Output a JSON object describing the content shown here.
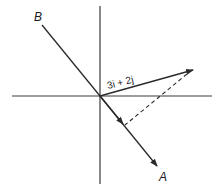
{
  "diagram": {
    "type": "vector-projection",
    "colors": {
      "line": "#2a2a2a",
      "background": "#ffffff"
    },
    "labels": {
      "point_b": "B",
      "point_a": "A",
      "vector": "3i + 2j"
    },
    "elements": [
      {
        "name": "x-axis",
        "kind": "axis"
      },
      {
        "name": "y-axis",
        "kind": "axis"
      },
      {
        "name": "line-ba",
        "kind": "line",
        "through": "origin",
        "arrow_toward": "A"
      },
      {
        "name": "vector-3i-2j",
        "kind": "arrow",
        "label": "3i + 2j"
      },
      {
        "name": "projection-dashed",
        "kind": "dashed-line",
        "from": "tip of 3i + 2j",
        "to": "line OA (perpendicular)"
      }
    ]
  }
}
